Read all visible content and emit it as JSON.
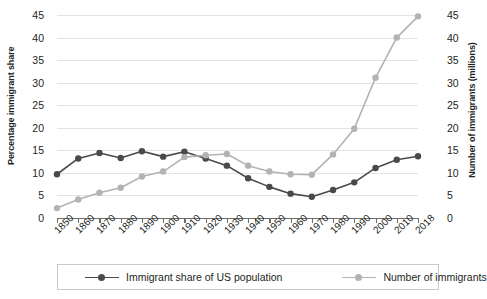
{
  "chart_data": {
    "type": "line",
    "title": "",
    "subtitle": "",
    "xlabel": "",
    "ylabel": "Percentage immigrant share",
    "y2label": "Number of immigrants (millions)",
    "grid": true,
    "legend_position": "bottom",
    "ylim": [
      0,
      45
    ],
    "y2lim": [
      0,
      45
    ],
    "yticks": [
      "45",
      "40",
      "35",
      "30",
      "25",
      "20",
      "15",
      "10",
      "5",
      "0"
    ],
    "y2ticks": [
      "45",
      "40",
      "35",
      "30",
      "25",
      "20",
      "15",
      "10",
      "5",
      "0"
    ],
    "categories": [
      "1850",
      "1860",
      "1870",
      "1880",
      "1890",
      "1900",
      "1910",
      "1920",
      "1930",
      "1940",
      "1950",
      "1960",
      "1970",
      "1980",
      "1990",
      "2000",
      "2010",
      "2018"
    ],
    "series": [
      {
        "name": "Immigrant share of US population",
        "color": "#4a4a4a",
        "axis": "left",
        "unit": "percent",
        "values": [
          9.7,
          13.2,
          14.4,
          13.3,
          14.8,
          13.6,
          14.7,
          13.2,
          11.6,
          8.8,
          6.9,
          5.4,
          4.7,
          6.2,
          7.9,
          11.1,
          12.9,
          13.7
        ]
      },
      {
        "name": "Number of immigrants",
        "color": "#b3b3b3",
        "axis": "right",
        "unit": "millions",
        "values": [
          2.2,
          4.1,
          5.6,
          6.7,
          9.2,
          10.3,
          13.5,
          13.9,
          14.2,
          11.6,
          10.3,
          9.7,
          9.6,
          14.1,
          19.8,
          31.1,
          40.0,
          44.7
        ]
      }
    ]
  },
  "legend": {
    "entries": [
      {
        "label": "Immigrant share of US population"
      },
      {
        "label": "Number of immigrants"
      }
    ]
  }
}
